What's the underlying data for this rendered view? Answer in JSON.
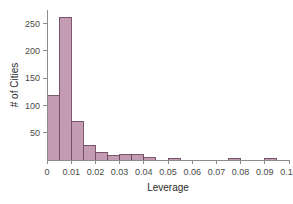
{
  "chart_data": {
    "type": "bar",
    "subtype": "histogram",
    "title": "",
    "xlabel": "Leverage",
    "ylabel": "# of Cities",
    "xlim": [
      0,
      0.1
    ],
    "ylim": [
      0,
      275
    ],
    "bin_width": 0.005,
    "grid": false,
    "legend": false,
    "bar_fill_color": "#c39cb4",
    "bar_edge_color": "#6b4a5e",
    "axis_color": "#8c8c8c",
    "background_color": "#ffffff",
    "x_tick_labels": [
      "0",
      "0.01",
      "0.02",
      "0.03",
      "0.04",
      "0.05",
      "0.06",
      "0.07",
      "0.08",
      "0.09",
      "0.10"
    ],
    "x_tick_values": [
      0,
      0.01,
      0.02,
      0.03,
      0.04,
      0.05,
      0.06,
      0.07,
      0.08,
      0.09,
      0.1
    ],
    "y_tick_labels": [
      "50",
      "100",
      "150",
      "200",
      "250"
    ],
    "y_tick_values": [
      50,
      100,
      150,
      200,
      250
    ],
    "bins": [
      {
        "x0": 0.0,
        "x1": 0.005,
        "count": 118
      },
      {
        "x0": 0.005,
        "x1": 0.01,
        "count": 262
      },
      {
        "x0": 0.01,
        "x1": 0.015,
        "count": 71
      },
      {
        "x0": 0.015,
        "x1": 0.02,
        "count": 27
      },
      {
        "x0": 0.02,
        "x1": 0.025,
        "count": 14
      },
      {
        "x0": 0.025,
        "x1": 0.03,
        "count": 8
      },
      {
        "x0": 0.03,
        "x1": 0.035,
        "count": 11
      },
      {
        "x0": 0.035,
        "x1": 0.04,
        "count": 10
      },
      {
        "x0": 0.04,
        "x1": 0.045,
        "count": 4
      },
      {
        "x0": 0.045,
        "x1": 0.05,
        "count": 0
      },
      {
        "x0": 0.05,
        "x1": 0.055,
        "count": 3
      },
      {
        "x0": 0.055,
        "x1": 0.06,
        "count": 0
      },
      {
        "x0": 0.06,
        "x1": 0.065,
        "count": 0
      },
      {
        "x0": 0.065,
        "x1": 0.07,
        "count": 0
      },
      {
        "x0": 0.07,
        "x1": 0.075,
        "count": 0
      },
      {
        "x0": 0.075,
        "x1": 0.08,
        "count": 3
      },
      {
        "x0": 0.08,
        "x1": 0.085,
        "count": 0
      },
      {
        "x0": 0.085,
        "x1": 0.09,
        "count": 0
      },
      {
        "x0": 0.09,
        "x1": 0.095,
        "count": 3
      },
      {
        "x0": 0.095,
        "x1": 0.1,
        "count": 0
      }
    ]
  }
}
